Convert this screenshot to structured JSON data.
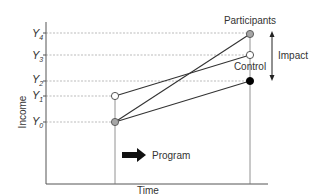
{
  "diagram": {
    "y_axis_label": "Income",
    "x_axis_label": "Time",
    "y_levels": [
      {
        "name": "Y",
        "sub": "4"
      },
      {
        "name": "Y",
        "sub": "3"
      },
      {
        "name": "Y",
        "sub": "2"
      },
      {
        "name": "Y",
        "sub": "1"
      },
      {
        "name": "Y",
        "sub": "0"
      }
    ],
    "labels": {
      "participants": "Participants",
      "control": "Control",
      "impact": "Impact",
      "program": "Program"
    },
    "colors": {
      "participant_point": "#a6a6a6",
      "control_point": "#ffffff",
      "counterfactual_point": "#000000",
      "line": "#333333",
      "gridline": "#999999"
    }
  }
}
